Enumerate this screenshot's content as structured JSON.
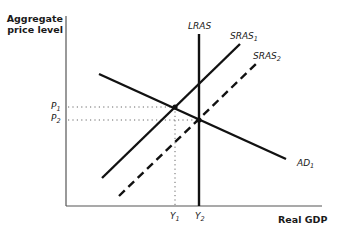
{
  "diagram": {
    "type": "AD-AS model",
    "y_axis_label_line1": "Aggregate",
    "y_axis_label_line2": "price level",
    "x_axis_label": "Real GDP",
    "curves": {
      "lras": {
        "label": "LRAS",
        "style": "solid"
      },
      "sras1": {
        "label": "SRAS",
        "subscript": "1",
        "style": "solid"
      },
      "sras2": {
        "label": "SRAS",
        "subscript": "2",
        "style": "dashed"
      },
      "ad1": {
        "label": "AD",
        "subscript": "1",
        "style": "solid"
      }
    },
    "price_ticks": [
      {
        "label": "P",
        "subscript": "1"
      },
      {
        "label": "P",
        "subscript": "2"
      }
    ],
    "output_ticks": [
      {
        "label": "Y",
        "subscript": "1"
      },
      {
        "label": "Y",
        "subscript": "2"
      }
    ],
    "equilibria": [
      {
        "name": "E1",
        "between": [
          "AD1",
          "SRAS1"
        ],
        "price": "P1",
        "output": "Y1"
      },
      {
        "name": "E2",
        "between": [
          "AD1",
          "SRAS2",
          "LRAS"
        ],
        "price": "P2",
        "output": "Y2"
      }
    ],
    "colors": {
      "line": "#111111",
      "axis": "#555555",
      "guide": "#666666"
    }
  }
}
